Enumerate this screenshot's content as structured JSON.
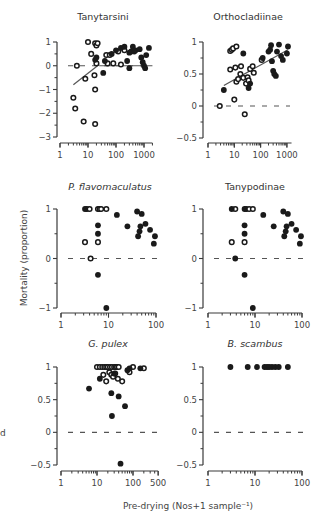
{
  "figure": {
    "ylabel": "Mortality (proportion)",
    "xlabel": "Pre-drying (Nos+1 sample⁻¹)",
    "side_fragment": "d"
  },
  "chart_data": [
    {
      "type": "scatter",
      "title": "Tanytarsini",
      "title_italic": false,
      "xscale": "log",
      "xlim": [
        1,
        2000
      ],
      "xticks": [
        "1",
        "10",
        "100",
        "1000"
      ],
      "xtick_values": [
        1,
        10,
        100,
        1000
      ],
      "ylim": [
        -3,
        1
      ],
      "yticks": [
        "1",
        "0",
        "−1",
        "−2",
        "−3"
      ],
      "ytick_values": [
        1,
        0,
        -1,
        -2,
        -3
      ],
      "zero_line": true,
      "fit_line": {
        "x": [
          3,
          2000
        ],
        "y": [
          -0.8,
          0.0
        ]
      },
      "fit_line_segments": [
        {
          "x": [
            3,
            25
          ],
          "y": [
            -0.8,
            0.05
          ]
        },
        {
          "x": [
            25,
            2000
          ],
          "y": [
            0.0,
            0.0
          ]
        }
      ],
      "series": [
        {
          "name": "open",
          "marker": "open-circle",
          "points": [
            [
              4,
              0.0
            ],
            [
              3,
              -1.35
            ],
            [
              3.5,
              -1.8
            ],
            [
              8,
              -0.55
            ],
            [
              7,
              -2.35
            ],
            [
              18,
              -2.45
            ],
            [
              18,
              -1.0
            ],
            [
              17,
              -0.4
            ],
            [
              10,
              1.0
            ],
            [
              13,
              0.5
            ],
            [
              18,
              0.95
            ],
            [
              20,
              0.85
            ],
            [
              22,
              0.95
            ],
            [
              20,
              0.1
            ],
            [
              45,
              0.45
            ],
            [
              50,
              0.1
            ],
            [
              60,
              0.45
            ],
            [
              80,
              0.1
            ],
            [
              120,
              0.6
            ],
            [
              150,
              0.05
            ],
            [
              200,
              0.65
            ]
          ]
        },
        {
          "name": "filled",
          "marker": "filled-circle",
          "points": [
            [
              18,
              0.25
            ],
            [
              20,
              0.35
            ],
            [
              35,
              -0.3
            ],
            [
              40,
              0.2
            ],
            [
              70,
              0.5
            ],
            [
              100,
              0.65
            ],
            [
              150,
              0.75
            ],
            [
              200,
              0.8
            ],
            [
              250,
              0.2
            ],
            [
              300,
              -0.1
            ],
            [
              300,
              0.55
            ],
            [
              350,
              0.6
            ],
            [
              400,
              0.8
            ],
            [
              450,
              0.6
            ],
            [
              500,
              0.65
            ],
            [
              700,
              0.7
            ],
            [
              800,
              0.35
            ],
            [
              900,
              0.15
            ],
            [
              1000,
              0.0
            ],
            [
              1100,
              -0.1
            ],
            [
              1200,
              0.45
            ],
            [
              1500,
              0.75
            ]
          ]
        }
      ]
    },
    {
      "type": "scatter",
      "title": "Orthocladiinae",
      "title_italic": false,
      "xscale": "log",
      "xlim": [
        1,
        1500
      ],
      "xticks": [
        "1",
        "10",
        "100",
        "1000"
      ],
      "xtick_values": [
        1,
        10,
        100,
        1000
      ],
      "ylim": [
        -0.5,
        1
      ],
      "yticks": [
        "1",
        "0.5",
        "0",
        "−0.5"
      ],
      "ytick_values": [
        1,
        0.5,
        0,
        -0.5
      ],
      "zero_line": true,
      "fit_line": {
        "x": [
          4,
          1100
        ],
        "y": [
          0.32,
          0.88
        ]
      },
      "series": [
        {
          "name": "open",
          "marker": "open-circle",
          "points": [
            [
              2.8,
              0.0
            ],
            [
              7,
              0.57
            ],
            [
              7,
              0.86
            ],
            [
              8,
              0.88
            ],
            [
              9,
              0.9
            ],
            [
              10,
              0.1
            ],
            [
              11,
              0.6
            ],
            [
              12,
              0.38
            ],
            [
              12,
              0.93
            ],
            [
              14,
              0.42
            ],
            [
              17,
              0.5
            ],
            [
              18,
              0.62
            ],
            [
              22,
              0.44
            ],
            [
              25,
              -0.13
            ],
            [
              28,
              0.35
            ],
            [
              32,
              0.45
            ],
            [
              35,
              0.4
            ],
            [
              40,
              0.58
            ],
            [
              50,
              0.62
            ],
            [
              55,
              0.52
            ],
            [
              110,
              0.72
            ]
          ]
        },
        {
          "name": "filled",
          "marker": "filled-circle",
          "points": [
            [
              4,
              0.25
            ],
            [
              22,
              0.82
            ],
            [
              35,
              0.28
            ],
            [
              40,
              0.35
            ],
            [
              120,
              0.75
            ],
            [
              200,
              0.85
            ],
            [
              230,
              0.88
            ],
            [
              250,
              0.95
            ],
            [
              270,
              0.7
            ],
            [
              300,
              0.55
            ],
            [
              330,
              0.5
            ],
            [
              380,
              0.47
            ],
            [
              420,
              0.85
            ],
            [
              500,
              0.96
            ],
            [
              600,
              0.78
            ],
            [
              700,
              0.72
            ],
            [
              1000,
              0.82
            ],
            [
              1100,
              0.93
            ]
          ]
        }
      ]
    },
    {
      "type": "scatter",
      "title": "P. flavomaculatus",
      "title_italic": true,
      "xscale": "log",
      "xlim": [
        1,
        100
      ],
      "xticks": [
        "1",
        "10",
        "100"
      ],
      "xtick_values": [
        1,
        10,
        100
      ],
      "ylim": [
        -1,
        1
      ],
      "yticks": [
        "1",
        "0",
        "−1"
      ],
      "ytick_values": [
        1,
        0,
        -1
      ],
      "zero_line": true,
      "series": [
        {
          "name": "open",
          "marker": "open-circle",
          "points": [
            [
              3.2,
              0.33
            ],
            [
              3.5,
              1.0
            ],
            [
              4,
              1.0
            ],
            [
              4.2,
              0.0
            ],
            [
              6,
              0.33
            ],
            [
              6,
              1.0
            ],
            [
              6.5,
              1.0
            ],
            [
              7,
              1.0
            ],
            [
              9,
              1.0
            ]
          ]
        },
        {
          "name": "filled",
          "marker": "filled-circle",
          "points": [
            [
              3.2,
              1.0
            ],
            [
              6,
              0.67
            ],
            [
              6,
              0.5
            ],
            [
              6,
              -0.33
            ],
            [
              9,
              -1.0
            ],
            [
              15,
              0.88
            ],
            [
              25,
              0.65
            ],
            [
              40,
              0.95
            ],
            [
              42,
              0.45
            ],
            [
              45,
              0.55
            ],
            [
              47,
              0.65
            ],
            [
              50,
              0.9
            ],
            [
              60,
              0.7
            ],
            [
              75,
              0.58
            ],
            [
              90,
              0.3
            ],
            [
              95,
              0.45
            ]
          ]
        }
      ]
    },
    {
      "type": "scatter",
      "title": "Tanypodinae",
      "title_italic": false,
      "xscale": "log",
      "xlim": [
        1,
        100
      ],
      "xticks": [
        "1",
        "10",
        "100"
      ],
      "xtick_values": [
        1,
        10,
        100
      ],
      "ylim": [
        -1,
        1
      ],
      "yticks": [
        "1",
        "0",
        "−1"
      ],
      "ytick_values": [
        1,
        0,
        -1
      ],
      "zero_line": true,
      "series": [
        {
          "name": "open",
          "marker": "open-circle",
          "points": [
            [
              3.2,
              0.33
            ],
            [
              3.8,
              1.0
            ],
            [
              6,
              0.33
            ],
            [
              6.5,
              1.0
            ],
            [
              7.5,
              1.0
            ],
            [
              9,
              1.0
            ]
          ]
        },
        {
          "name": "filled",
          "marker": "filled-circle",
          "points": [
            [
              3.2,
              1.0
            ],
            [
              3.8,
              0.0
            ],
            [
              6,
              1.0
            ],
            [
              6,
              0.67
            ],
            [
              6,
              0.5
            ],
            [
              6,
              -0.33
            ],
            [
              9,
              -1.0
            ],
            [
              15,
              0.88
            ],
            [
              25,
              0.65
            ],
            [
              40,
              0.95
            ],
            [
              42,
              0.45
            ],
            [
              45,
              0.55
            ],
            [
              47,
              0.65
            ],
            [
              50,
              0.9
            ],
            [
              60,
              0.7
            ],
            [
              75,
              0.58
            ],
            [
              90,
              0.3
            ],
            [
              95,
              0.45
            ]
          ]
        }
      ]
    },
    {
      "type": "scatter",
      "title": "G. pulex",
      "title_italic": true,
      "xscale": "log",
      "xlim": [
        1,
        500
      ],
      "xticks": [
        "1",
        "10",
        "100",
        "500"
      ],
      "xtick_values": [
        1,
        10,
        100,
        500
      ],
      "ylim": [
        -0.5,
        1
      ],
      "yticks": [
        "1",
        "0.5",
        "0",
        "−0.5"
      ],
      "ytick_values": [
        1,
        0.5,
        0,
        -0.5
      ],
      "zero_line": true,
      "series": [
        {
          "name": "open",
          "marker": "open-circle",
          "points": [
            [
              10,
              1.0
            ],
            [
              12,
              1.0
            ],
            [
              14,
              1.0
            ],
            [
              16,
              1.0
            ],
            [
              18,
              1.0
            ],
            [
              20,
              1.0
            ],
            [
              23,
              1.0
            ],
            [
              26,
              1.0
            ],
            [
              30,
              1.0
            ],
            [
              33,
              1.0
            ],
            [
              36,
              1.0
            ],
            [
              40,
              1.0
            ],
            [
              15,
              0.88
            ],
            [
              18,
              0.78
            ],
            [
              22,
              0.92
            ],
            [
              25,
              0.88
            ],
            [
              28,
              0.85
            ],
            [
              32,
              0.9
            ],
            [
              38,
              0.82
            ],
            [
              50,
              0.78
            ],
            [
              80,
              0.92
            ],
            [
              100,
              1.0
            ],
            [
              200,
              0.98
            ]
          ]
        },
        {
          "name": "filled",
          "marker": "filled-circle",
          "points": [
            [
              6,
              0.67
            ],
            [
              12,
              0.82
            ],
            [
              25,
              0.6
            ],
            [
              26,
              0.25
            ],
            [
              30,
              0.9
            ],
            [
              40,
              0.55
            ],
            [
              45,
              -0.48
            ],
            [
              60,
              0.4
            ],
            [
              70,
              0.95
            ],
            [
              80,
              0.98
            ],
            [
              160,
              0.98
            ]
          ]
        }
      ]
    },
    {
      "type": "scatter",
      "title": "B. scambus",
      "title_italic": true,
      "xscale": "log",
      "xlim": [
        1,
        100
      ],
      "xticks": [
        "1",
        "10",
        "100"
      ],
      "xtick_values": [
        1,
        10,
        100
      ],
      "ylim": [
        -0.5,
        1
      ],
      "yticks": [
        "1",
        "0.5",
        "0",
        "−0.5"
      ],
      "ytick_values": [
        1,
        0.5,
        0,
        -0.5
      ],
      "zero_line": true,
      "series": [
        {
          "name": "filled",
          "marker": "filled-circle",
          "points": [
            [
              3,
              1.0
            ],
            [
              7,
              1.0
            ],
            [
              11,
              1.0
            ],
            [
              16,
              1.0
            ],
            [
              18,
              1.0
            ],
            [
              20,
              1.0
            ],
            [
              23,
              1.0
            ],
            [
              27,
              1.0
            ],
            [
              32,
              1.0
            ],
            [
              50,
              1.0
            ]
          ]
        }
      ]
    }
  ],
  "layout": {
    "panels": [
      {
        "axis_x": 57,
        "plot_left": 60,
        "plot_right": 148,
        "xaxis_y": 143,
        "y_top_px": 42,
        "y_bot_px": 137,
        "title_x": 103,
        "title_y": 20,
        "log_px_per_decade": 28,
        "log_origin_px": 60
      },
      {
        "axis_x": 203,
        "plot_left": 206,
        "plot_right": 290,
        "xaxis_y": 143,
        "y_top_px": 42,
        "y_bot_px": 138,
        "title_x": 248,
        "title_y": 20,
        "log_px_per_decade": 26.3,
        "log_origin_px": 208
      },
      {
        "axis_x": 57,
        "plot_left": 60,
        "plot_right": 158,
        "xaxis_y": 313,
        "y_top_px": 209,
        "y_bot_px": 308,
        "title_x": 110,
        "title_y": 190,
        "log_px_per_decade": 47.5,
        "log_origin_px": 61
      },
      {
        "axis_x": 203,
        "plot_left": 206,
        "plot_right": 304,
        "xaxis_y": 313,
        "y_top_px": 209,
        "y_bot_px": 308,
        "title_x": 255,
        "title_y": 190,
        "log_px_per_decade": 47,
        "log_origin_px": 208
      },
      {
        "axis_x": 57,
        "plot_left": 60,
        "plot_right": 157,
        "xaxis_y": 471,
        "y_top_px": 367,
        "y_bot_px": 465,
        "title_x": 108,
        "title_y": 347,
        "log_px_per_decade": 36,
        "log_origin_px": 61
      },
      {
        "axis_x": 203,
        "plot_left": 206,
        "plot_right": 304,
        "xaxis_y": 471,
        "y_top_px": 367,
        "y_bot_px": 465,
        "title_x": 255,
        "title_y": 347,
        "log_px_per_decade": 47,
        "log_origin_px": 208
      }
    ]
  },
  "colors": {
    "axis": "#3a3a3a",
    "marker": "#1a1a1a",
    "dash": "#555555",
    "text": "#333333"
  }
}
